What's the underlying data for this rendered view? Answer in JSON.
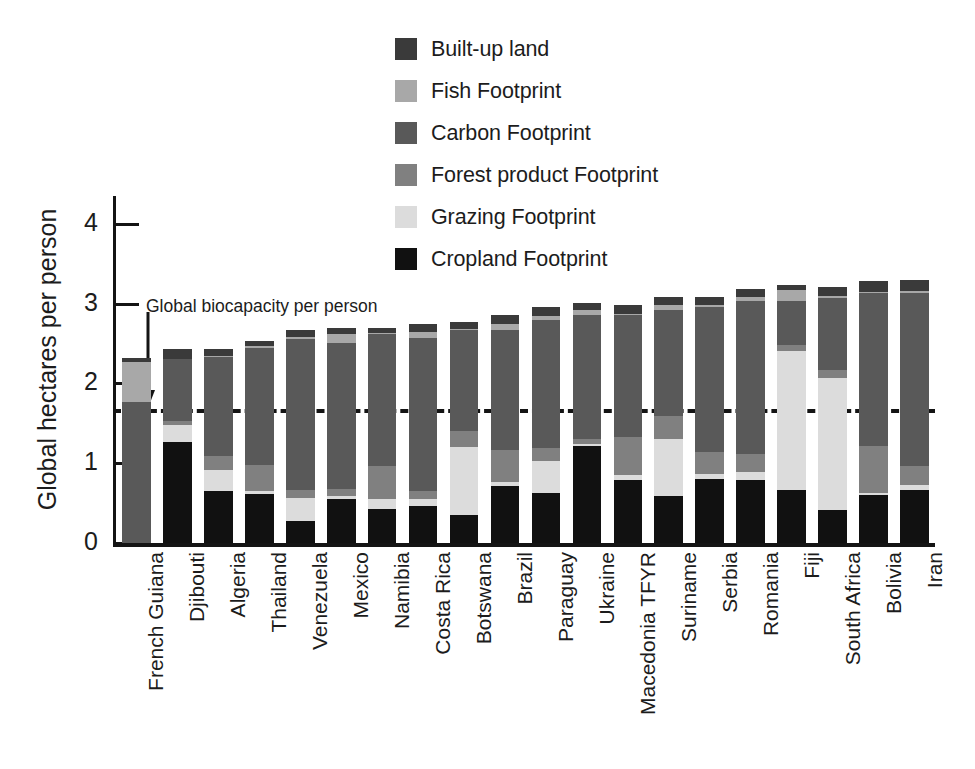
{
  "chart_data": {
    "type": "bar",
    "subtype": "stacked-bar",
    "title": "",
    "xlabel": "",
    "ylabel": "Global hectares per person",
    "ylim": [
      0,
      4.35
    ],
    "yticks": [
      0,
      1,
      2,
      3,
      4
    ],
    "ytick_labels": [
      "0",
      "1",
      "2",
      "3",
      "4"
    ],
    "grid": false,
    "legend_position": "top-center",
    "annotations": [
      {
        "name": "global-biocapacity",
        "label": "Global biocapacity per person",
        "type": "horizontal-dashed-line",
        "value": 1.68
      }
    ],
    "categories": [
      "French Guiana",
      "Djibouti",
      "Algeria",
      "Thailand",
      "Venezuela",
      "Mexico",
      "Namibia",
      "Costa Rica",
      "Botswana",
      "Brazil",
      "Paraguay",
      "Ukraine",
      "Macedonia TFYR",
      "Suriname",
      "Serbia",
      "Romania",
      "Fiji",
      "South Africa",
      "Bolivia",
      "Iran"
    ],
    "series": [
      {
        "name": "Cropland Footprint",
        "color": "#111111",
        "values": [
          0.0,
          1.27,
          0.65,
          0.61,
          0.28,
          0.55,
          0.43,
          0.47,
          0.35,
          0.71,
          0.63,
          1.22,
          0.79,
          0.59,
          0.8,
          0.79,
          0.67,
          0.41,
          0.6,
          0.66
        ]
      },
      {
        "name": "Grazing Footprint",
        "color": "#dcdcdc",
        "values": [
          0.0,
          0.21,
          0.26,
          0.04,
          0.29,
          0.04,
          0.12,
          0.08,
          0.86,
          0.05,
          0.4,
          0.02,
          0.06,
          0.72,
          0.06,
          0.1,
          1.74,
          1.66,
          0.03,
          0.07
        ]
      },
      {
        "name": "Forest product Footprint",
        "color": "#808080",
        "values": [
          0.0,
          0.05,
          0.18,
          0.33,
          0.09,
          0.09,
          0.42,
          0.1,
          0.2,
          0.41,
          0.16,
          0.06,
          0.48,
          0.28,
          0.28,
          0.23,
          0.07,
          0.1,
          0.58,
          0.23
        ]
      },
      {
        "name": "Carbon Footprint",
        "color": "#595959",
        "values": [
          1.77,
          0.78,
          1.24,
          1.46,
          1.9,
          1.83,
          1.65,
          1.92,
          1.26,
          1.5,
          1.61,
          1.56,
          1.53,
          1.33,
          1.82,
          1.92,
          0.55,
          0.9,
          1.93,
          2.18
        ]
      },
      {
        "name": "Fish Footprint",
        "color": "#a8a8a8",
        "values": [
          0.5,
          0.0,
          0.02,
          0.03,
          0.02,
          0.11,
          0.01,
          0.07,
          0.01,
          0.07,
          0.04,
          0.06,
          0.01,
          0.06,
          0.02,
          0.05,
          0.14,
          0.03,
          0.01,
          0.02
        ]
      },
      {
        "name": "Built-up land",
        "color": "#3a3a3a",
        "values": [
          0.05,
          0.12,
          0.08,
          0.06,
          0.09,
          0.08,
          0.07,
          0.1,
          0.09,
          0.12,
          0.12,
          0.09,
          0.12,
          0.11,
          0.11,
          0.1,
          0.07,
          0.11,
          0.13,
          0.14
        ]
      }
    ],
    "totals": [
      2.32,
      2.43,
      2.43,
      2.53,
      2.67,
      2.7,
      2.7,
      2.74,
      2.77,
      2.86,
      2.96,
      3.01,
      2.99,
      3.09,
      3.09,
      3.19,
      3.24,
      3.21,
      3.28,
      3.3
    ]
  },
  "legend": {
    "items": [
      {
        "label": "Built-up land",
        "color": "#3a3a3a"
      },
      {
        "label": "Fish Footprint",
        "color": "#a8a8a8"
      },
      {
        "label": "Carbon Footprint",
        "color": "#595959"
      },
      {
        "label": "Forest product Footprint",
        "color": "#808080"
      },
      {
        "label": "Grazing Footprint",
        "color": "#dcdcdc"
      },
      {
        "label": "Cropland Footprint",
        "color": "#111111"
      }
    ]
  },
  "axis": {
    "y_title": "Global hectares per person",
    "y_tick_labels": [
      "4",
      "3",
      "2",
      "1",
      "0"
    ]
  },
  "annotation": {
    "biocapacity_label": "Global biocapacity per person"
  }
}
